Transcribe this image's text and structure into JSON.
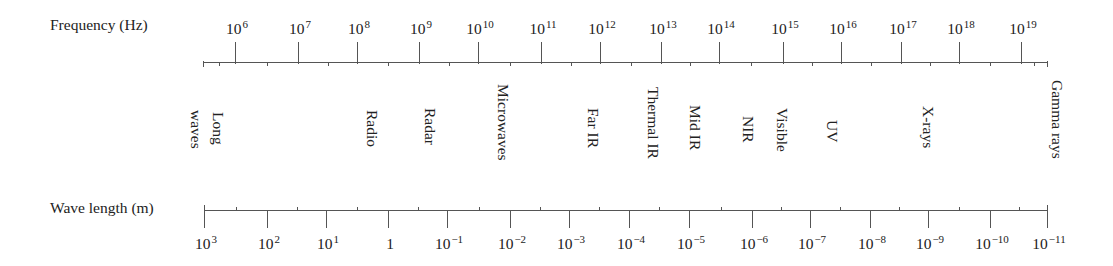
{
  "frequency_axis": {
    "title": "Frequency (Hz)",
    "line": {
      "x1": 203,
      "x2": 1047,
      "y": 62
    },
    "ticks": [
      {
        "x": 235,
        "base": "10",
        "exp": "6"
      },
      {
        "x": 298,
        "base": "10",
        "exp": "7"
      },
      {
        "x": 357,
        "base": "10",
        "exp": "8"
      },
      {
        "x": 419,
        "base": "10",
        "exp": "9"
      },
      {
        "x": 478,
        "base": "10",
        "exp": "10"
      },
      {
        "x": 541,
        "base": "10",
        "exp": "11"
      },
      {
        "x": 600,
        "base": "10",
        "exp": "12"
      },
      {
        "x": 661,
        "base": "10",
        "exp": "13"
      },
      {
        "x": 719,
        "base": "10",
        "exp": "14"
      },
      {
        "x": 783,
        "base": "10",
        "exp": "15"
      },
      {
        "x": 841,
        "base": "10",
        "exp": "16"
      },
      {
        "x": 901,
        "base": "10",
        "exp": "17"
      },
      {
        "x": 959,
        "base": "10",
        "exp": "18"
      },
      {
        "x": 1021,
        "base": "10",
        "exp": "19"
      }
    ]
  },
  "wavelength_axis": {
    "title": "Wave length (m)",
    "line": {
      "x1": 204,
      "x2": 1047,
      "y": 210
    },
    "ticks": [
      {
        "x": 204,
        "base": "10",
        "exp": "3"
      },
      {
        "x": 267,
        "base": "10",
        "exp": "2"
      },
      {
        "x": 326,
        "base": "10",
        "exp": "1"
      },
      {
        "x": 388,
        "base": "1",
        "exp": ""
      },
      {
        "x": 447,
        "base": "10",
        "exp": "−1"
      },
      {
        "x": 510,
        "base": "10",
        "exp": "−2"
      },
      {
        "x": 569,
        "base": "10",
        "exp": "−3"
      },
      {
        "x": 629,
        "base": "10",
        "exp": "−4"
      },
      {
        "x": 689,
        "base": "10",
        "exp": "−5"
      },
      {
        "x": 752,
        "base": "10",
        "exp": "−6"
      },
      {
        "x": 810,
        "base": "10",
        "exp": "−7"
      },
      {
        "x": 870,
        "base": "10",
        "exp": "−8"
      },
      {
        "x": 928,
        "base": "10",
        "exp": "−9"
      },
      {
        "x": 990,
        "base": "10",
        "exp": "−10"
      },
      {
        "x": 1047,
        "base": "10",
        "exp": "−11"
      }
    ]
  },
  "bands": [
    {
      "label": "Long",
      "x": 226,
      "y": 112
    },
    {
      "label": "waves",
      "x": 204,
      "y": 110
    },
    {
      "label": "Radio",
      "x": 380,
      "y": 110
    },
    {
      "label": "Radar",
      "x": 438,
      "y": 108
    },
    {
      "label": "Microwaves",
      "x": 511,
      "y": 84
    },
    {
      "label": "Far IR",
      "x": 601,
      "y": 108
    },
    {
      "label": "Thermal IR",
      "x": 661,
      "y": 87
    },
    {
      "label": "Mid IR",
      "x": 703,
      "y": 105
    },
    {
      "label": "NIR",
      "x": 756,
      "y": 116
    },
    {
      "label": "Visible",
      "x": 790,
      "y": 108
    },
    {
      "label": "UV",
      "x": 840,
      "y": 120
    },
    {
      "label": "X-rays",
      "x": 936,
      "y": 106
    },
    {
      "label": "Gamma rays",
      "x": 1065,
      "y": 80
    }
  ]
}
